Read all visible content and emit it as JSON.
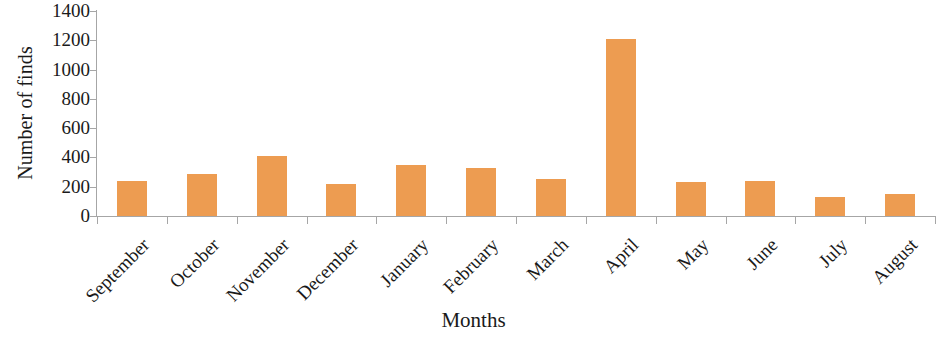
{
  "chart_data": {
    "type": "bar",
    "title": "",
    "xlabel": "Months",
    "ylabel": "Number of finds",
    "categories": [
      "September",
      "October",
      "November",
      "December",
      "January",
      "February",
      "March",
      "April",
      "May",
      "June",
      "July",
      "August"
    ],
    "values": [
      240,
      285,
      410,
      220,
      345,
      325,
      250,
      1210,
      235,
      240,
      130,
      150
    ],
    "ylim": [
      0,
      1400
    ],
    "ytick_labels": [
      "1400",
      "1200",
      "1000",
      "800",
      "600",
      "400",
      "200",
      "0"
    ],
    "ytick_values": [
      1400,
      1200,
      1000,
      800,
      600,
      400,
      200,
      0
    ],
    "ytick_step": 200,
    "grid": false,
    "legend": false,
    "legend_position": "none",
    "bar_color": "#ed9c51",
    "axis_color": "#a6a6a6",
    "text_color": "#1a1a1a",
    "xtick_label_rotation": -45
  }
}
